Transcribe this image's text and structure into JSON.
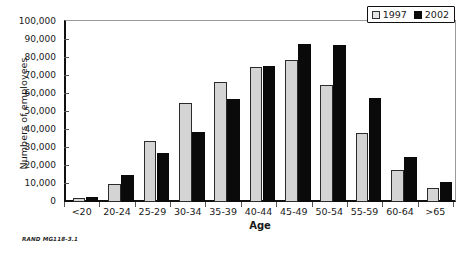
{
  "figure": {
    "footer_note": "RAND MG118-3.1"
  },
  "legend": {
    "position": "top-right",
    "entries": [
      {
        "label": "1997",
        "color": "#e6e6e6"
      },
      {
        "label": "2002",
        "color": "#0a0a0a"
      }
    ]
  },
  "chart_data": {
    "type": "bar",
    "title": "",
    "xlabel": "Age",
    "ylabel": "Numbers of employees",
    "ylim": [
      0,
      100000
    ],
    "ytick_labels": [
      "100,000",
      "90,000",
      "80,000",
      "70,000",
      "60,000",
      "50,000",
      "40,000",
      "30,000",
      "20,000",
      "10,000",
      "0"
    ],
    "ytick_values": [
      100000,
      90000,
      80000,
      70000,
      60000,
      50000,
      40000,
      30000,
      20000,
      10000,
      0
    ],
    "grid": false,
    "legend_position": "top-right",
    "categories": [
      "<20",
      "20-24",
      "25-29",
      "30-34",
      "35-39",
      "40-44",
      "45-49",
      "50-54",
      "55-59",
      "60-64",
      ">65"
    ],
    "series": [
      {
        "name": "1997",
        "color": "#d4d4d4",
        "values": [
          2000,
          10000,
          34000,
          55000,
          66500,
          75000,
          79000,
          65000,
          38500,
          18000,
          8000
        ]
      },
      {
        "name": "2002",
        "color": "#0a0a0a",
        "values": [
          3000,
          15000,
          27000,
          39000,
          57000,
          75500,
          88000,
          87000,
          58000,
          25000,
          11000
        ]
      }
    ]
  }
}
